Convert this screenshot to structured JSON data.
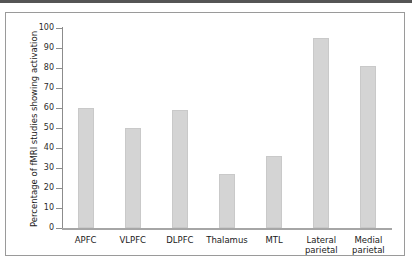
{
  "figure": {
    "background_color": "#ffffff",
    "frame_color": "#9a9a9a",
    "top_rule_color": "#555555"
  },
  "chart_data": {
    "type": "bar",
    "title": "",
    "xlabel": "",
    "ylabel": "Percentage of fMRI studies showing activation",
    "ylim": [
      0,
      100
    ],
    "ytick_step": 10,
    "ytick_labels": [
      "100",
      "90",
      "80",
      "70",
      "60",
      "50",
      "40",
      "30",
      "20",
      "10",
      "0"
    ],
    "grid": false,
    "legend": null,
    "bar_color": "#d4d4d4",
    "bar_edge_color": "#c9c9c9",
    "categories": [
      "APFC",
      "VLPFC",
      "DLPFC",
      "Thalamus",
      "MTL",
      "Lateral parietal",
      "Medial parietal"
    ],
    "category_lines": [
      [
        "APFC"
      ],
      [
        "VLPFC"
      ],
      [
        "DLPFC"
      ],
      [
        "Thalamus"
      ],
      [
        "MTL"
      ],
      [
        "Lateral",
        "parietal"
      ],
      [
        "Medial",
        "parietal"
      ]
    ],
    "values": [
      60,
      50,
      59,
      27,
      36,
      95,
      81
    ]
  }
}
